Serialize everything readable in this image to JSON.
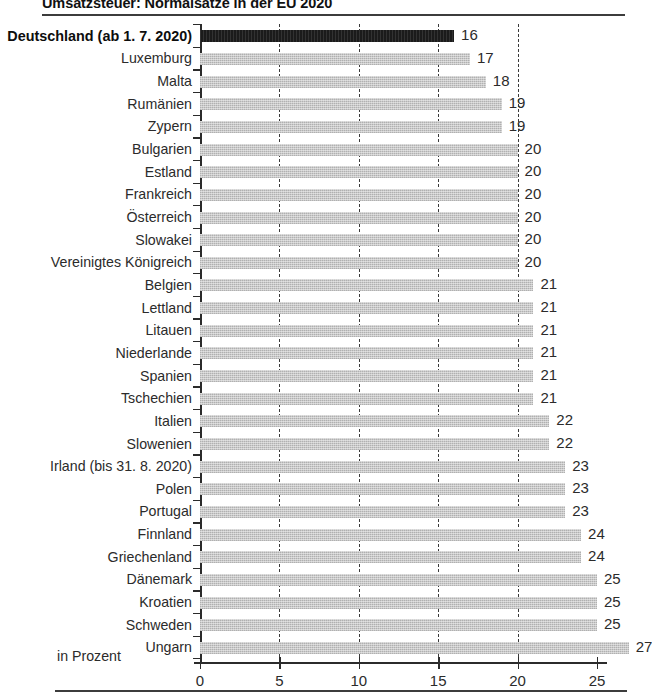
{
  "chart_data": {
    "type": "bar",
    "orientation": "horizontal",
    "title": "Umsatzsteuer: Normalsätze in der EU 2020",
    "xlabel": "in Prozent",
    "ylabel": "",
    "xlim": [
      0,
      25
    ],
    "xticks": [
      0,
      5,
      10,
      15,
      20,
      25
    ],
    "xticklabels": [
      "0",
      "5",
      "10",
      "15",
      "20",
      "25"
    ],
    "gridlines": [
      5,
      10,
      15,
      20
    ],
    "grid": true,
    "legend": false,
    "categories": [
      "Deutschland (ab 1. 7. 2020)",
      "Luxemburg",
      "Malta",
      "Rumänien",
      "Zypern",
      "Bulgarien",
      "Estland",
      "Frankreich",
      "Österreich",
      "Slowakei",
      "Vereinigtes Königreich",
      "Belgien",
      "Lettland",
      "Litauen",
      "Niederlande",
      "Spanien",
      "Tschechien",
      "Italien",
      "Slowenien",
      "Irland (bis 31. 8. 2020)",
      "Polen",
      "Portugal",
      "Finnland",
      "Griechenland",
      "Dänemark",
      "Kroatien",
      "Schweden",
      "Ungarn"
    ],
    "values": [
      16,
      17,
      18,
      19,
      19,
      20,
      20,
      20,
      20,
      20,
      20,
      21,
      21,
      21,
      21,
      21,
      21,
      22,
      22,
      23,
      23,
      23,
      24,
      24,
      25,
      25,
      25,
      27
    ],
    "value_labels": [
      "16",
      "17",
      "18",
      "19",
      "19",
      "20",
      "20",
      "20",
      "20",
      "20",
      "20",
      "21",
      "21",
      "21",
      "21",
      "21",
      "21",
      "22",
      "22",
      "23",
      "23",
      "23",
      "24",
      "24",
      "25",
      "25",
      "25",
      "27"
    ],
    "highlight_index": 0,
    "colors": {
      "bar": "#c9c9c9",
      "bar_highlight": "#1b1b1b",
      "axis": "#2b2b2b",
      "text": "#2b2b2b",
      "rule": "#3c3c3c"
    }
  }
}
